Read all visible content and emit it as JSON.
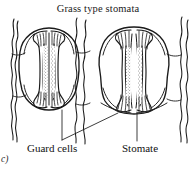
{
  "figure": {
    "title": "Grass type stomata",
    "index_label": "c)",
    "background_color": "#ffffff",
    "ink_color": "#1a1a1a"
  },
  "labels": {
    "guard_cells": "Guard cells",
    "stomate": "Stomate"
  },
  "structures": [
    {
      "name": "left-stoma",
      "state": "closed",
      "outline_shape": "oval",
      "pore_orientation": "vertical",
      "pore_style": "narrow-slit-stippled"
    },
    {
      "name": "right-stoma",
      "state": "open",
      "outline_shape": "angular-rounded",
      "pore_orientation": "vertical",
      "pore_style": "splayed-slit-stippled"
    }
  ],
  "epidermal_walls": {
    "name": "wavy-cell-wall-lines",
    "count": 5,
    "description": "wavy vertical epidermal cell wall boundaries"
  },
  "leader_lines": [
    {
      "name": "guard-cells-leader-left",
      "from_label": "guard_cells",
      "points_to": "left-stoma"
    },
    {
      "name": "guard-cells-leader-right",
      "from_label": "guard_cells",
      "points_to": "right-stoma"
    },
    {
      "name": "stomate-leader",
      "from_label": "stomate",
      "points_to": "right-stoma-pore"
    }
  ]
}
